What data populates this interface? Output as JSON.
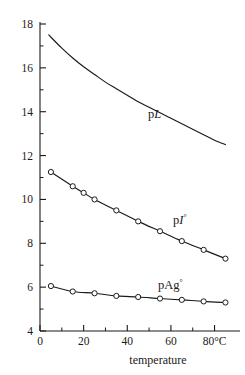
{
  "chart_data": {
    "type": "line",
    "title": "",
    "xlabel": "temperature",
    "ylabel": "",
    "xlim": [
      0,
      88
    ],
    "ylim": [
      4,
      18
    ],
    "grid": false,
    "legend_position": "inline-annotations",
    "x_unit": "°C",
    "x_ticks": [
      0,
      20,
      40,
      60,
      80
    ],
    "x_tick_labels": [
      "0",
      "20",
      "40",
      "60",
      "80°C"
    ],
    "x_minor_ticks": [
      10,
      30,
      50,
      70
    ],
    "y_ticks": [
      4,
      6,
      8,
      10,
      12,
      14,
      16,
      18
    ],
    "y_tick_labels": [
      "4",
      "6",
      "8",
      "10",
      "12",
      "14",
      "16",
      "18"
    ],
    "y_minor_ticks": [
      5,
      7,
      9,
      11,
      13,
      15,
      17
    ],
    "series": [
      {
        "name": "pL",
        "label": "pL",
        "label_prefix": "p",
        "label_italic": "L",
        "markers": false,
        "x": [
          4,
          10,
          15,
          20,
          25,
          30,
          35,
          40,
          45,
          50,
          55,
          60,
          65,
          70,
          75,
          80,
          85
        ],
        "values": [
          17.5,
          16.9,
          16.45,
          16.05,
          15.7,
          15.35,
          15.05,
          14.75,
          14.45,
          14.2,
          13.95,
          13.7,
          13.45,
          13.2,
          12.95,
          12.7,
          12.5
        ]
      },
      {
        "name": "pI",
        "label": "pI°",
        "label_prefix": "p",
        "label_italic": "I",
        "label_suffix": "°",
        "markers": true,
        "x": [
          5,
          15,
          20,
          25,
          35,
          45,
          55,
          65,
          75,
          85
        ],
        "values": [
          11.25,
          10.6,
          10.3,
          10.0,
          9.5,
          9.0,
          8.55,
          8.1,
          7.7,
          7.3
        ]
      },
      {
        "name": "pAg",
        "label": "pAg°",
        "label_prefix": "pAg",
        "label_suffix": "°",
        "markers": true,
        "x": [
          5,
          15,
          25,
          35,
          45,
          55,
          65,
          75,
          85
        ],
        "values": [
          6.05,
          5.8,
          5.72,
          5.6,
          5.55,
          5.48,
          5.42,
          5.35,
          5.3
        ]
      }
    ]
  },
  "colors": {
    "ink": "#1a1a1a",
    "background": "#ffffff",
    "marker_fill": "#ffffff"
  }
}
